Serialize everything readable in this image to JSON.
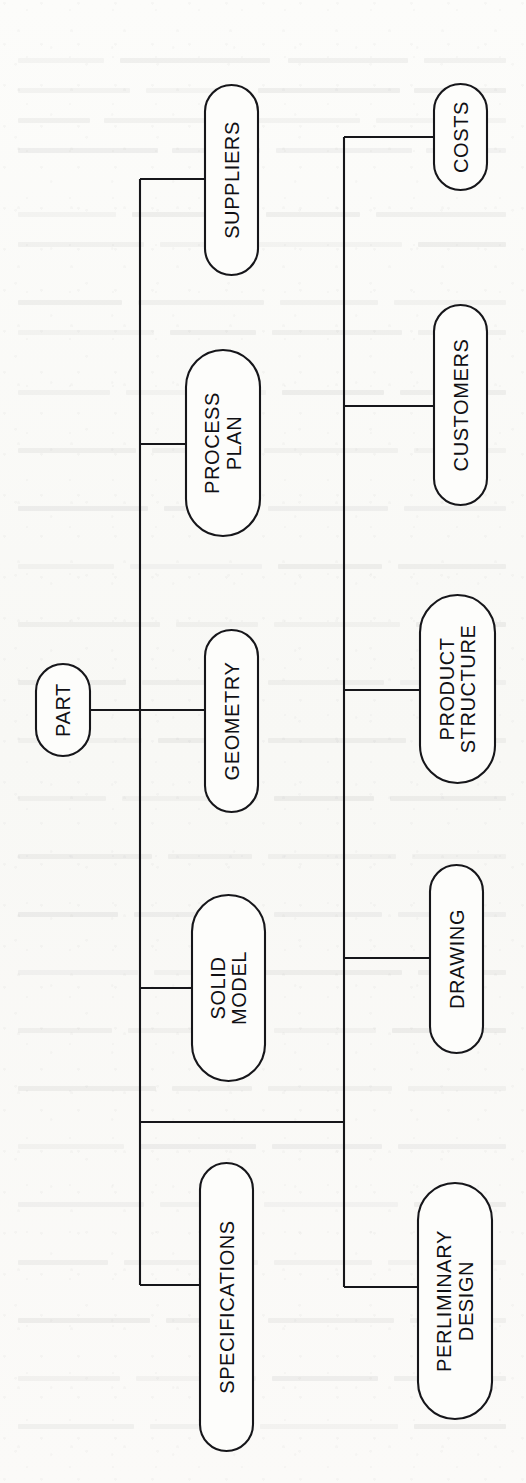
{
  "document": {
    "kind": "scanned-page-figure",
    "orientation": "rotated-90-ccw",
    "background_color": "#fbfbf9",
    "ink_color": "#16161a"
  },
  "diagram": {
    "title": "PART",
    "root": {
      "id": "part",
      "label": "PART"
    },
    "nodes": [
      {
        "id": "part",
        "label": "PART",
        "lines": [
          "PART"
        ],
        "x": 36,
        "y": 664,
        "w": 54,
        "h": 92,
        "font_size": 20
      },
      {
        "id": "suppliers",
        "label": "SUPPLIERS",
        "lines": [
          "SUPPLIERS"
        ],
        "x": 205,
        "y": 85,
        "w": 53,
        "h": 190,
        "font_size": 20
      },
      {
        "id": "process-plan",
        "label": "PROCESS PLAN",
        "lines": [
          "PROCESS",
          "PLAN"
        ],
        "x": 186,
        "y": 350,
        "w": 74,
        "h": 186,
        "font_size": 20
      },
      {
        "id": "geometry",
        "label": "GEOMETRY",
        "lines": [
          "GEOMETRY"
        ],
        "x": 205,
        "y": 630,
        "w": 53,
        "h": 182,
        "font_size": 20
      },
      {
        "id": "solid-model",
        "label": "SOLID MODEL",
        "lines": [
          "SOLID",
          "MODEL"
        ],
        "x": 192,
        "y": 895,
        "w": 73,
        "h": 186,
        "font_size": 20
      },
      {
        "id": "specifications",
        "label": "SPECIFICATIONS",
        "lines": [
          "SPECIFICATIONS"
        ],
        "x": 200,
        "y": 1163,
        "w": 53,
        "h": 288,
        "font_size": 20
      },
      {
        "id": "costs",
        "label": "COSTS",
        "lines": [
          "COSTS"
        ],
        "x": 434,
        "y": 84,
        "w": 53,
        "h": 106,
        "font_size": 20
      },
      {
        "id": "customers",
        "label": "CUSTOMERS",
        "lines": [
          "CUSTOMERS"
        ],
        "x": 434,
        "y": 305,
        "w": 53,
        "h": 200,
        "font_size": 20
      },
      {
        "id": "product-structure",
        "label": "PRODUCT STRUCTURE",
        "lines": [
          "PRODUCT",
          "STRUCTURE"
        ],
        "x": 420,
        "y": 595,
        "w": 75,
        "h": 188,
        "font_size": 20
      },
      {
        "id": "drawing",
        "label": "DRAWING",
        "lines": [
          "DRAWING"
        ],
        "x": 430,
        "y": 865,
        "w": 53,
        "h": 188,
        "font_size": 20
      },
      {
        "id": "perliminary-design",
        "label": "PERLIMINARY DESIGN",
        "lines": [
          "PERLIMINARY",
          "DESIGN"
        ],
        "x": 418,
        "y": 1183,
        "w": 74,
        "h": 236,
        "font_size": 20
      }
    ],
    "edges": [
      {
        "id": "edge-part-to-trunk1",
        "from": "part",
        "to": "trunk-1",
        "d": "M 90 710 L 140 710"
      },
      {
        "id": "trunk-1",
        "from": "trunk-1",
        "to": "trunk-1",
        "d": "M 140 179 L 140 1285"
      },
      {
        "id": "edge-trunk1-suppliers",
        "from": "trunk-1",
        "to": "suppliers",
        "d": "M 140 179 L 205 179"
      },
      {
        "id": "edge-trunk1-process-plan",
        "from": "trunk-1",
        "to": "process-plan",
        "d": "M 140 444 L 186 444"
      },
      {
        "id": "edge-trunk1-geometry",
        "from": "trunk-1",
        "to": "geometry",
        "d": "M 140 710 L 205 710"
      },
      {
        "id": "edge-trunk1-solid-model",
        "from": "trunk-1",
        "to": "solid-model",
        "d": "M 140 988 L 192 988"
      },
      {
        "id": "edge-trunk1-specifications",
        "from": "trunk-1",
        "to": "specifications",
        "d": "M 140 1285 L 200 1285"
      },
      {
        "id": "edge-trunk1-trunk2",
        "from": "trunk-1",
        "to": "trunk-2",
        "d": "M 140 1122 L 344 1122"
      },
      {
        "id": "trunk-2",
        "from": "trunk-2",
        "to": "trunk-2",
        "d": "M 344 137 L 344 1287"
      },
      {
        "id": "edge-trunk2-costs",
        "from": "trunk-2",
        "to": "costs",
        "d": "M 344 137 L 434 137"
      },
      {
        "id": "edge-trunk2-customers",
        "from": "trunk-2",
        "to": "customers",
        "d": "M 344 406 L 434 406"
      },
      {
        "id": "edge-trunk2-product-structure",
        "from": "trunk-2",
        "to": "product-structure",
        "d": "M 344 690 L 420 690"
      },
      {
        "id": "edge-trunk2-drawing",
        "from": "trunk-2",
        "to": "drawing",
        "d": "M 344 958 L 430 958"
      },
      {
        "id": "edge-trunk2-perliminary-design",
        "from": "trunk-2",
        "to": "perliminary-design",
        "d": "M 344 1287 L 418 1287"
      }
    ]
  },
  "bleed_marks": [
    {
      "x": 18,
      "y": 58,
      "w": 86,
      "h": 5
    },
    {
      "x": 120,
      "y": 58,
      "w": 150,
      "h": 5
    },
    {
      "x": 288,
      "y": 58,
      "w": 120,
      "h": 5
    },
    {
      "x": 424,
      "y": 58,
      "w": 82,
      "h": 5
    },
    {
      "x": 18,
      "y": 88,
      "w": 112,
      "h": 5
    },
    {
      "x": 146,
      "y": 88,
      "w": 96,
      "h": 5
    },
    {
      "x": 258,
      "y": 88,
      "w": 142,
      "h": 5
    },
    {
      "x": 414,
      "y": 88,
      "w": 92,
      "h": 5
    },
    {
      "x": 18,
      "y": 118,
      "w": 72,
      "h": 5
    },
    {
      "x": 104,
      "y": 118,
      "w": 132,
      "h": 5
    },
    {
      "x": 252,
      "y": 118,
      "w": 108,
      "h": 5
    },
    {
      "x": 376,
      "y": 118,
      "w": 130,
      "h": 5
    },
    {
      "x": 18,
      "y": 148,
      "w": 140,
      "h": 5
    },
    {
      "x": 172,
      "y": 148,
      "w": 88,
      "h": 5
    },
    {
      "x": 276,
      "y": 148,
      "w": 136,
      "h": 5
    },
    {
      "x": 426,
      "y": 148,
      "w": 80,
      "h": 5
    },
    {
      "x": 18,
      "y": 212,
      "w": 98,
      "h": 5
    },
    {
      "x": 132,
      "y": 212,
      "w": 118,
      "h": 5
    },
    {
      "x": 266,
      "y": 212,
      "w": 94,
      "h": 5
    },
    {
      "x": 376,
      "y": 212,
      "w": 130,
      "h": 5
    },
    {
      "x": 18,
      "y": 242,
      "w": 126,
      "h": 5
    },
    {
      "x": 160,
      "y": 242,
      "w": 80,
      "h": 5
    },
    {
      "x": 256,
      "y": 242,
      "w": 146,
      "h": 5
    },
    {
      "x": 418,
      "y": 242,
      "w": 88,
      "h": 5
    },
    {
      "x": 18,
      "y": 300,
      "w": 104,
      "h": 5
    },
    {
      "x": 138,
      "y": 300,
      "w": 126,
      "h": 5
    },
    {
      "x": 280,
      "y": 300,
      "w": 98,
      "h": 5
    },
    {
      "x": 394,
      "y": 300,
      "w": 112,
      "h": 5
    },
    {
      "x": 18,
      "y": 330,
      "w": 136,
      "h": 5
    },
    {
      "x": 170,
      "y": 330,
      "w": 86,
      "h": 5
    },
    {
      "x": 272,
      "y": 330,
      "w": 130,
      "h": 5
    },
    {
      "x": 418,
      "y": 330,
      "w": 88,
      "h": 5
    },
    {
      "x": 18,
      "y": 390,
      "w": 92,
      "h": 5
    },
    {
      "x": 126,
      "y": 390,
      "w": 140,
      "h": 5
    },
    {
      "x": 282,
      "y": 390,
      "w": 102,
      "h": 5
    },
    {
      "x": 400,
      "y": 390,
      "w": 106,
      "h": 5
    },
    {
      "x": 18,
      "y": 448,
      "w": 118,
      "h": 5
    },
    {
      "x": 152,
      "y": 448,
      "w": 96,
      "h": 5
    },
    {
      "x": 264,
      "y": 448,
      "w": 134,
      "h": 5
    },
    {
      "x": 414,
      "y": 448,
      "w": 92,
      "h": 5
    },
    {
      "x": 18,
      "y": 506,
      "w": 130,
      "h": 5
    },
    {
      "x": 164,
      "y": 506,
      "w": 88,
      "h": 5
    },
    {
      "x": 268,
      "y": 506,
      "w": 120,
      "h": 5
    },
    {
      "x": 404,
      "y": 506,
      "w": 102,
      "h": 5
    },
    {
      "x": 18,
      "y": 564,
      "w": 96,
      "h": 5
    },
    {
      "x": 130,
      "y": 564,
      "w": 132,
      "h": 5
    },
    {
      "x": 278,
      "y": 564,
      "w": 104,
      "h": 5
    },
    {
      "x": 398,
      "y": 564,
      "w": 108,
      "h": 5
    },
    {
      "x": 18,
      "y": 622,
      "w": 142,
      "h": 5
    },
    {
      "x": 176,
      "y": 622,
      "w": 82,
      "h": 5
    },
    {
      "x": 274,
      "y": 622,
      "w": 126,
      "h": 5
    },
    {
      "x": 416,
      "y": 622,
      "w": 90,
      "h": 5
    },
    {
      "x": 18,
      "y": 680,
      "w": 108,
      "h": 5
    },
    {
      "x": 142,
      "y": 680,
      "w": 110,
      "h": 5
    },
    {
      "x": 268,
      "y": 680,
      "w": 116,
      "h": 5
    },
    {
      "x": 400,
      "y": 680,
      "w": 106,
      "h": 5
    },
    {
      "x": 18,
      "y": 738,
      "w": 124,
      "h": 5
    },
    {
      "x": 158,
      "y": 738,
      "w": 94,
      "h": 5
    },
    {
      "x": 268,
      "y": 738,
      "w": 138,
      "h": 5
    },
    {
      "x": 422,
      "y": 738,
      "w": 84,
      "h": 5
    },
    {
      "x": 18,
      "y": 796,
      "w": 88,
      "h": 5
    },
    {
      "x": 122,
      "y": 796,
      "w": 136,
      "h": 5
    },
    {
      "x": 274,
      "y": 796,
      "w": 100,
      "h": 5
    },
    {
      "x": 390,
      "y": 796,
      "w": 116,
      "h": 5
    },
    {
      "x": 18,
      "y": 854,
      "w": 134,
      "h": 5
    },
    {
      "x": 168,
      "y": 854,
      "w": 84,
      "h": 5
    },
    {
      "x": 268,
      "y": 854,
      "w": 128,
      "h": 5
    },
    {
      "x": 412,
      "y": 854,
      "w": 94,
      "h": 5
    },
    {
      "x": 18,
      "y": 912,
      "w": 100,
      "h": 5
    },
    {
      "x": 134,
      "y": 912,
      "w": 124,
      "h": 5
    },
    {
      "x": 274,
      "y": 912,
      "w": 108,
      "h": 5
    },
    {
      "x": 398,
      "y": 912,
      "w": 108,
      "h": 5
    },
    {
      "x": 18,
      "y": 970,
      "w": 120,
      "h": 5
    },
    {
      "x": 154,
      "y": 970,
      "w": 92,
      "h": 5
    },
    {
      "x": 262,
      "y": 970,
      "w": 140,
      "h": 5
    },
    {
      "x": 418,
      "y": 970,
      "w": 88,
      "h": 5
    },
    {
      "x": 18,
      "y": 1028,
      "w": 94,
      "h": 5
    },
    {
      "x": 128,
      "y": 1028,
      "w": 130,
      "h": 5
    },
    {
      "x": 274,
      "y": 1028,
      "w": 102,
      "h": 5
    },
    {
      "x": 392,
      "y": 1028,
      "w": 114,
      "h": 5
    },
    {
      "x": 18,
      "y": 1086,
      "w": 138,
      "h": 5
    },
    {
      "x": 172,
      "y": 1086,
      "w": 80,
      "h": 5
    },
    {
      "x": 268,
      "y": 1086,
      "w": 124,
      "h": 5
    },
    {
      "x": 408,
      "y": 1086,
      "w": 98,
      "h": 5
    },
    {
      "x": 18,
      "y": 1144,
      "w": 106,
      "h": 5
    },
    {
      "x": 140,
      "y": 1144,
      "w": 116,
      "h": 5
    },
    {
      "x": 272,
      "y": 1144,
      "w": 110,
      "h": 5
    },
    {
      "x": 398,
      "y": 1144,
      "w": 108,
      "h": 5
    },
    {
      "x": 18,
      "y": 1202,
      "w": 126,
      "h": 5
    },
    {
      "x": 160,
      "y": 1202,
      "w": 88,
      "h": 5
    },
    {
      "x": 264,
      "y": 1202,
      "w": 134,
      "h": 5
    },
    {
      "x": 414,
      "y": 1202,
      "w": 92,
      "h": 5
    },
    {
      "x": 18,
      "y": 1260,
      "w": 90,
      "h": 5
    },
    {
      "x": 124,
      "y": 1260,
      "w": 134,
      "h": 5
    },
    {
      "x": 274,
      "y": 1260,
      "w": 98,
      "h": 5
    },
    {
      "x": 388,
      "y": 1260,
      "w": 118,
      "h": 5
    },
    {
      "x": 18,
      "y": 1318,
      "w": 132,
      "h": 5
    },
    {
      "x": 166,
      "y": 1318,
      "w": 86,
      "h": 5
    },
    {
      "x": 268,
      "y": 1318,
      "w": 126,
      "h": 5
    },
    {
      "x": 410,
      "y": 1318,
      "w": 96,
      "h": 5
    },
    {
      "x": 18,
      "y": 1376,
      "w": 102,
      "h": 5
    },
    {
      "x": 136,
      "y": 1376,
      "w": 120,
      "h": 5
    },
    {
      "x": 272,
      "y": 1376,
      "w": 106,
      "h": 5
    },
    {
      "x": 394,
      "y": 1376,
      "w": 112,
      "h": 5
    },
    {
      "x": 18,
      "y": 1424,
      "w": 116,
      "h": 5
    },
    {
      "x": 150,
      "y": 1424,
      "w": 94,
      "h": 5
    },
    {
      "x": 260,
      "y": 1424,
      "w": 138,
      "h": 5
    },
    {
      "x": 414,
      "y": 1424,
      "w": 92,
      "h": 5
    }
  ]
}
